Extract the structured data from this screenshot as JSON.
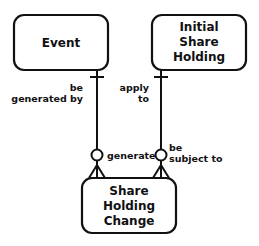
{
  "diagram": {
    "type": "entity-relationship",
    "entities": [
      {
        "id": "event",
        "lines": [
          "Event"
        ]
      },
      {
        "id": "initial-share-holding",
        "lines": [
          "Initial",
          "Share",
          "Holding"
        ]
      },
      {
        "id": "share-holding-change",
        "lines": [
          "Share",
          "Holding",
          "Change"
        ]
      }
    ],
    "relationships": [
      {
        "from": "event",
        "to": "share-holding-change",
        "from_label": [
          "be",
          "generated by"
        ],
        "to_label": [
          "generate"
        ],
        "from_cardinality": "one (mandatory)",
        "to_cardinality": "zero or many"
      },
      {
        "from": "initial-share-holding",
        "to": "share-holding-change",
        "from_label": [
          "apply",
          "to"
        ],
        "to_label": [
          "be",
          "subject to"
        ],
        "from_cardinality": "one (mandatory)",
        "to_cardinality": "zero or many"
      }
    ]
  },
  "colors": {
    "stroke": "#111111",
    "background": "#ffffff"
  }
}
